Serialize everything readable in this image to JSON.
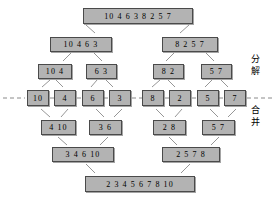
{
  "diagram": {
    "colors": {
      "node_fill": "#b3b3b3",
      "node_border": "#4a4a4a",
      "line": "#8a8a8a",
      "dashed_line": "#8a8a8a",
      "text": "#000000",
      "background": "#ffffff"
    },
    "labels": {
      "decompose": "分 解",
      "merge": "合 并"
    },
    "levels": [
      {
        "name": "level-0-root",
        "phase": "decompose",
        "nodes": [
          {
            "text": "10 4 6 3 8 2 5 7",
            "x": 83,
            "y": 8,
            "w": 110,
            "h": 16,
            "fs": 8
          }
        ]
      },
      {
        "name": "level-1-split",
        "phase": "decompose",
        "nodes": [
          {
            "text": "10 4 6 3",
            "x": 50,
            "y": 37,
            "w": 62,
            "h": 15,
            "fs": 8
          },
          {
            "text": "8 2 5 7",
            "x": 162,
            "y": 37,
            "w": 56,
            "h": 15,
            "fs": 8
          }
        ]
      },
      {
        "name": "level-2-split",
        "phase": "decompose",
        "nodes": [
          {
            "text": "10 4",
            "x": 38,
            "y": 64,
            "w": 34,
            "h": 15,
            "fs": 8
          },
          {
            "text": "6 3",
            "x": 86,
            "y": 64,
            "w": 31,
            "h": 15,
            "fs": 8
          },
          {
            "text": "8 2",
            "x": 153,
            "y": 64,
            "w": 31,
            "h": 15,
            "fs": 8
          },
          {
            "text": "5 7",
            "x": 201,
            "y": 64,
            "w": 31,
            "h": 15,
            "fs": 8
          }
        ]
      },
      {
        "name": "level-3-leaves",
        "phase": "boundary",
        "nodes": [
          {
            "text": "10",
            "x": 27,
            "y": 90,
            "w": 22,
            "h": 16,
            "fs": 8
          },
          {
            "text": "4",
            "x": 54,
            "y": 90,
            "w": 22,
            "h": 16,
            "fs": 8
          },
          {
            "text": "6",
            "x": 82,
            "y": 90,
            "w": 22,
            "h": 16,
            "fs": 8
          },
          {
            "text": "3",
            "x": 109,
            "y": 90,
            "w": 22,
            "h": 16,
            "fs": 8
          },
          {
            "text": "8",
            "x": 142,
            "y": 90,
            "w": 22,
            "h": 16,
            "fs": 8
          },
          {
            "text": "2",
            "x": 169,
            "y": 90,
            "w": 22,
            "h": 16,
            "fs": 8
          },
          {
            "text": "5",
            "x": 197,
            "y": 90,
            "w": 22,
            "h": 16,
            "fs": 8
          },
          {
            "text": "7",
            "x": 224,
            "y": 90,
            "w": 22,
            "h": 16,
            "fs": 8
          }
        ]
      },
      {
        "name": "level-4-merge",
        "phase": "merge",
        "nodes": [
          {
            "text": "4 10",
            "x": 41,
            "y": 120,
            "w": 35,
            "h": 15,
            "fs": 8
          },
          {
            "text": "3 6",
            "x": 89,
            "y": 120,
            "w": 33,
            "h": 15,
            "fs": 8
          },
          {
            "text": "2 8",
            "x": 153,
            "y": 120,
            "w": 33,
            "h": 15,
            "fs": 8
          },
          {
            "text": "5 7",
            "x": 202,
            "y": 120,
            "w": 33,
            "h": 15,
            "fs": 8
          }
        ]
      },
      {
        "name": "level-5-merge",
        "phase": "merge",
        "nodes": [
          {
            "text": "3 4 6 10",
            "x": 52,
            "y": 147,
            "w": 62,
            "h": 15,
            "fs": 8
          },
          {
            "text": "2 5 7 8",
            "x": 162,
            "y": 147,
            "w": 58,
            "h": 15,
            "fs": 8
          }
        ]
      },
      {
        "name": "level-6-result",
        "phase": "merge",
        "nodes": [
          {
            "text": "2 3 4 5 6 7 8 10",
            "x": 85,
            "y": 176,
            "w": 110,
            "h": 16,
            "fs": 8
          }
        ]
      }
    ],
    "connectors": [
      {
        "x1": 95,
        "y1": 33,
        "x2": 86,
        "y2": 25
      },
      {
        "x1": 180,
        "y1": 33,
        "x2": 189,
        "y2": 25
      },
      {
        "x1": 63,
        "y1": 61,
        "x2": 71,
        "y2": 53
      },
      {
        "x1": 102,
        "y1": 61,
        "x2": 94,
        "y2": 53
      },
      {
        "x1": 166,
        "y1": 61,
        "x2": 174,
        "y2": 53
      },
      {
        "x1": 214,
        "y1": 61,
        "x2": 206,
        "y2": 53
      },
      {
        "x1": 42,
        "y1": 87,
        "x2": 50,
        "y2": 80
      },
      {
        "x1": 63,
        "y1": 87,
        "x2": 56,
        "y2": 80
      },
      {
        "x1": 91,
        "y1": 87,
        "x2": 97,
        "y2": 80
      },
      {
        "x1": 113,
        "y1": 87,
        "x2": 106,
        "y2": 80
      },
      {
        "x1": 152,
        "y1": 87,
        "x2": 160,
        "y2": 80
      },
      {
        "x1": 175,
        "y1": 87,
        "x2": 168,
        "y2": 80
      },
      {
        "x1": 205,
        "y1": 87,
        "x2": 212,
        "y2": 80
      },
      {
        "x1": 228,
        "y1": 87,
        "x2": 221,
        "y2": 80
      },
      {
        "x1": 41,
        "y1": 109,
        "x2": 50,
        "y2": 117
      },
      {
        "x1": 68,
        "y1": 109,
        "x2": 61,
        "y2": 117
      },
      {
        "x1": 96,
        "y1": 109,
        "x2": 104,
        "y2": 117
      },
      {
        "x1": 122,
        "y1": 109,
        "x2": 114,
        "y2": 117
      },
      {
        "x1": 156,
        "y1": 109,
        "x2": 164,
        "y2": 117
      },
      {
        "x1": 182,
        "y1": 109,
        "x2": 175,
        "y2": 117
      },
      {
        "x1": 210,
        "y1": 109,
        "x2": 218,
        "y2": 117
      },
      {
        "x1": 236,
        "y1": 109,
        "x2": 228,
        "y2": 117
      },
      {
        "x1": 58,
        "y1": 137,
        "x2": 67,
        "y2": 145
      },
      {
        "x1": 108,
        "y1": 137,
        "x2": 100,
        "y2": 145
      },
      {
        "x1": 169,
        "y1": 137,
        "x2": 177,
        "y2": 145
      },
      {
        "x1": 219,
        "y1": 137,
        "x2": 211,
        "y2": 145
      },
      {
        "x1": 86,
        "y1": 164,
        "x2": 95,
        "y2": 173
      },
      {
        "x1": 190,
        "y1": 164,
        "x2": 181,
        "y2": 173
      }
    ],
    "dashed_segments": [
      {
        "x1": 3,
        "y1": 98,
        "x2": 25,
        "y2": 98
      },
      {
        "x1": 50,
        "y1": 98,
        "x2": 54,
        "y2": 98
      },
      {
        "x1": 77,
        "y1": 98,
        "x2": 82,
        "y2": 98
      },
      {
        "x1": 104,
        "y1": 98,
        "x2": 109,
        "y2": 98
      },
      {
        "x1": 132,
        "y1": 98,
        "x2": 142,
        "y2": 98
      },
      {
        "x1": 165,
        "y1": 98,
        "x2": 169,
        "y2": 98
      },
      {
        "x1": 192,
        "y1": 98,
        "x2": 197,
        "y2": 98
      },
      {
        "x1": 219,
        "y1": 98,
        "x2": 224,
        "y2": 98
      },
      {
        "x1": 247,
        "y1": 98,
        "x2": 272,
        "y2": 98
      }
    ]
  }
}
